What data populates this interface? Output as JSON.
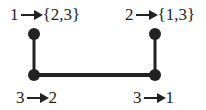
{
  "diagram": {
    "nodes": [
      {
        "id": "top-left",
        "x": 34,
        "y": 34
      },
      {
        "id": "bottom-left",
        "x": 34,
        "y": 75
      },
      {
        "id": "bottom-right",
        "x": 155,
        "y": 75
      },
      {
        "id": "top-right",
        "x": 155,
        "y": 34
      }
    ],
    "edges": [
      [
        "top-left",
        "bottom-left"
      ],
      [
        "bottom-left",
        "bottom-right"
      ],
      [
        "bottom-right",
        "top-right"
      ]
    ],
    "labels": {
      "top_left": {
        "from": "1",
        "to": "{2,3}"
      },
      "top_right": {
        "from": "2",
        "to": "{1,3}"
      },
      "bottom_left": {
        "from": "3",
        "to": "2"
      },
      "bottom_right": {
        "from": "3",
        "to": "1"
      }
    },
    "colors": {
      "ink": "#222222",
      "background": "#ffffff"
    }
  }
}
